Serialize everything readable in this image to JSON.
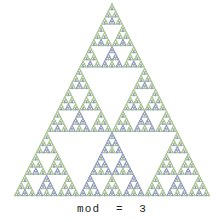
{
  "figure": {
    "caption": "mod  =  3",
    "modulus": 3,
    "background_color": "#ffffff",
    "apex": {
      "x": 112,
      "y": 3
    },
    "base_left": {
      "x": 17,
      "y": 196
    },
    "base_right": {
      "x": 213,
      "y": 196
    },
    "depth": 4,
    "cell_glyph": "small-triangle-outline"
  },
  "palette": {
    "residue_1_color": "#7ba05b",
    "residue_1_fill": "#dce8cf",
    "residue_2_color": "#5b6b97",
    "residue_2_fill": "#ccd3e6",
    "residue_0_color": "#ffffff",
    "caption_color": "#242424"
  },
  "chart_data": {
    "type": "heatmap",
    "subtitle": "mod  =  3",
    "xlabel": "",
    "ylabel": "",
    "modulus": 3,
    "rows": 81,
    "legend_position": "none",
    "grid": false,
    "categories": [
      "0",
      "1",
      "2"
    ],
    "series": [
      {
        "name": "residue 0",
        "color": "#ffffff",
        "rendered": false,
        "values": 2511
      },
      {
        "name": "residue 1",
        "color": "#7ba05b",
        "rendered": true,
        "values": 324
      },
      {
        "name": "residue 2",
        "color": "#5b6b97",
        "rendered": true,
        "values": 486
      }
    ],
    "recursion": {
      "levels": 4,
      "branching": 6,
      "child_offsets": [
        [
          0,
          0
        ],
        [
          1,
          0
        ],
        [
          1,
          1
        ],
        [
          2,
          0
        ],
        [
          2,
          1
        ],
        [
          2,
          2
        ]
      ],
      "multiplier_rule": "child value = parent value * C(row,col) mod 3"
    }
  }
}
